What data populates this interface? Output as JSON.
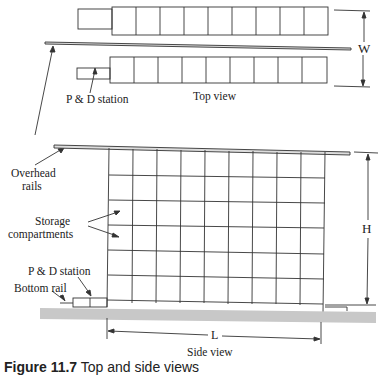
{
  "labels": {
    "top_view": "Top view",
    "side_view": "Side view",
    "pd_station_top": "P & D station",
    "pd_station_side": "P & D station",
    "overhead_rails_line1": "Overhead",
    "overhead_rails_line2": "rails",
    "storage_line1": "Storage",
    "storage_line2": "compartments",
    "bottom_rail": "Bottom rail",
    "dim_w": "W",
    "dim_h": "H",
    "dim_l": "L"
  },
  "caption": {
    "prefix": "Figure 11.7",
    "rest": " Top and side views"
  },
  "colors": {
    "line": "#333333",
    "floor": "#c8c8c8",
    "rail": "#9a9a9a"
  },
  "grid": {
    "columns": 9,
    "rows": 6
  }
}
